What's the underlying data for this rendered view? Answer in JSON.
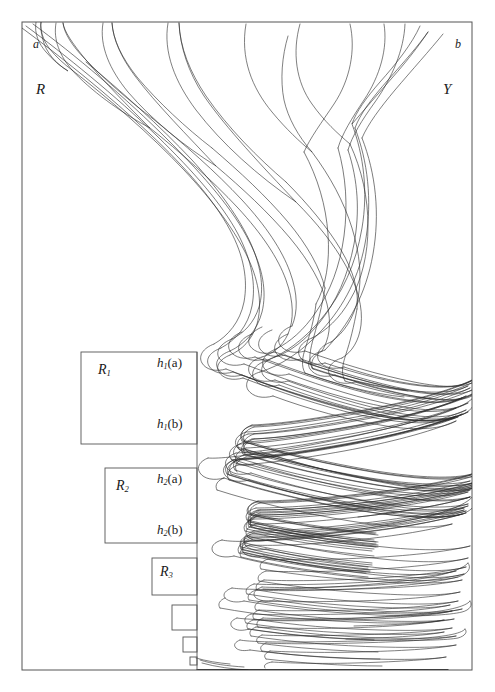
{
  "figure": {
    "type": "mathematical-diagram",
    "background_color": "#ffffff",
    "ink_color": "#1a1a1a",
    "frame": {
      "x": 22,
      "y": 22,
      "width": 450,
      "height": 648
    },
    "vertical_divider_x": 197
  },
  "labels": {
    "corner_top_left": "a",
    "corner_top_right": "b",
    "region_left": "R",
    "region_right": "Y"
  },
  "boxes": [
    {
      "name": "R",
      "sub": "1",
      "x": 81,
      "y": 352,
      "width": 116,
      "height": 92
    },
    {
      "name": "R",
      "sub": "2",
      "x": 105,
      "y": 468,
      "width": 92,
      "height": 75
    },
    {
      "name": "R",
      "sub": "3",
      "x": 152,
      "y": 558,
      "width": 45,
      "height": 37
    },
    {
      "name": "",
      "sub": "",
      "x": 172,
      "y": 605,
      "width": 25,
      "height": 25
    },
    {
      "name": "",
      "sub": "",
      "x": 183,
      "y": 637,
      "width": 14,
      "height": 15
    },
    {
      "name": "",
      "sub": "",
      "x": 190,
      "y": 657,
      "width": 7,
      "height": 8
    }
  ],
  "box_labels": [
    {
      "id": "R1",
      "text": "R",
      "sub": "1",
      "x": 98,
      "y": 363
    },
    {
      "id": "R2",
      "text": "R",
      "sub": "2",
      "x": 116,
      "y": 479
    },
    {
      "id": "R3",
      "text": "R",
      "sub": "3",
      "x": 160,
      "y": 565
    }
  ],
  "point_labels": [
    {
      "id": "h1a",
      "fn": "h",
      "sub": "1",
      "arg": "(a)",
      "x": 157,
      "y": 356
    },
    {
      "id": "h1b",
      "fn": "h",
      "sub": "1",
      "arg": "(b)",
      "x": 157,
      "y": 417
    },
    {
      "id": "h2a",
      "fn": "h",
      "sub": "2",
      "arg": "(a)",
      "x": 157,
      "y": 472
    },
    {
      "id": "h2b",
      "fn": "h",
      "sub": "2",
      "arg": "(b)",
      "x": 157,
      "y": 523
    }
  ],
  "chart_data": {
    "type": "line",
    "title": "",
    "xlabel": "",
    "ylabel": "",
    "xlim": [
      22,
      472
    ],
    "ylim": [
      22,
      670
    ],
    "grid": false,
    "legend": null,
    "top_fingers_count": 9,
    "fold_levels": 6,
    "strand_count": 14
  }
}
